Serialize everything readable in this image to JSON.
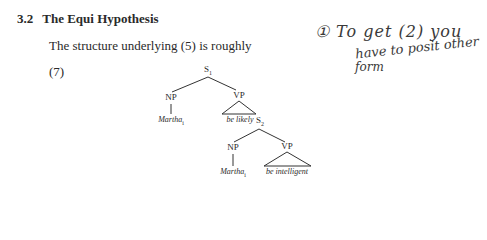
{
  "section": {
    "number": "3.2",
    "title": "The Equi Hypothesis"
  },
  "body_text": "The structure underlying (5) is roughly",
  "example_number": "(7)",
  "tree": {
    "root": "S",
    "root_sub": "1",
    "np1": "NP",
    "np1_leaf": "Martha",
    "np1_leaf_sub": "i",
    "vp1": "VP",
    "vp1_leaf": "be likely",
    "s2": "S",
    "s2_sub": "2",
    "np2": "NP",
    "np2_leaf": "Martha",
    "np2_leaf_sub": "i",
    "vp2": "VP",
    "vp2_leaf": "be intelligent"
  },
  "handwritten_note": {
    "line1": "① To get (2) you",
    "line2": "have to posit other",
    "line3": "form"
  }
}
